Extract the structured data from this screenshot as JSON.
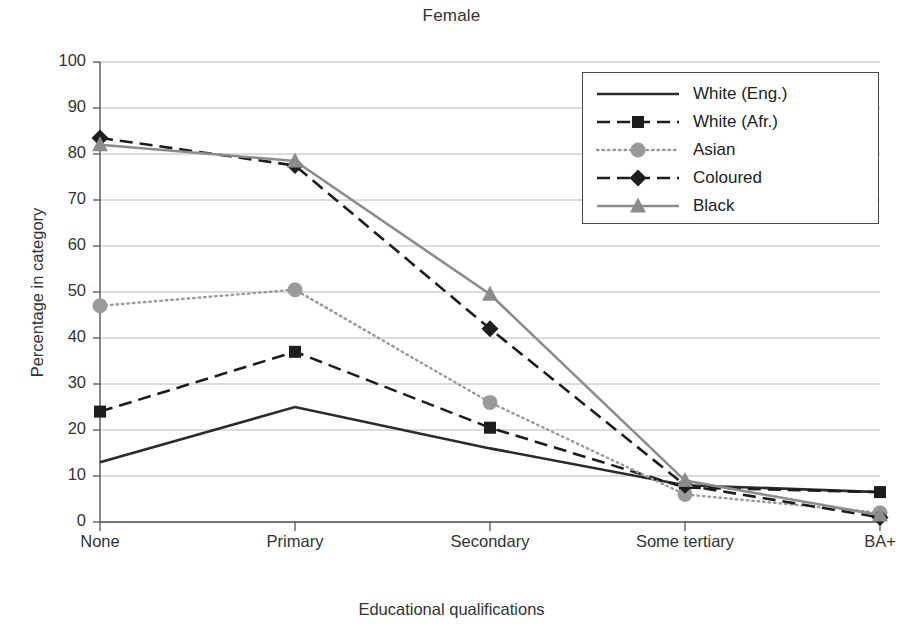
{
  "chart_data": {
    "type": "line",
    "title": "Female",
    "xlabel": "Educational qualifications",
    "ylabel": "Percentage in category",
    "categories": [
      "None",
      "Primary",
      "Secondary",
      "Some tertiary",
      "BA+"
    ],
    "ylim": [
      0,
      100
    ],
    "ytick_step": 10,
    "yticks": [
      100,
      90,
      80,
      70,
      60,
      50,
      40,
      30,
      20,
      10,
      0
    ],
    "grid": "horizontal",
    "legend_position": "top-right-inside",
    "series": [
      {
        "name": "White (Eng.)",
        "values": [
          13,
          25,
          16,
          8,
          6.5
        ],
        "line_style": "solid",
        "marker": "none",
        "color": "#2b2b2b"
      },
      {
        "name": "White (Afr.)",
        "values": [
          24,
          37,
          20.5,
          7.5,
          6.5
        ],
        "line_style": "dashed",
        "marker": "square",
        "color": "#1d1d1d"
      },
      {
        "name": "Asian",
        "values": [
          47,
          50.5,
          26,
          6,
          2
        ],
        "line_style": "dotted",
        "marker": "circle",
        "color": "#9a9a9a"
      },
      {
        "name": "Coloured",
        "values": [
          83.5,
          77.5,
          42,
          8,
          1
        ],
        "line_style": "dashed",
        "marker": "diamond",
        "color": "#1d1d1d"
      },
      {
        "name": "Black",
        "values": [
          82,
          78.5,
          49.5,
          9,
          1.5
        ],
        "line_style": "solid",
        "marker": "triangle",
        "color": "#8c8c8c"
      }
    ]
  }
}
